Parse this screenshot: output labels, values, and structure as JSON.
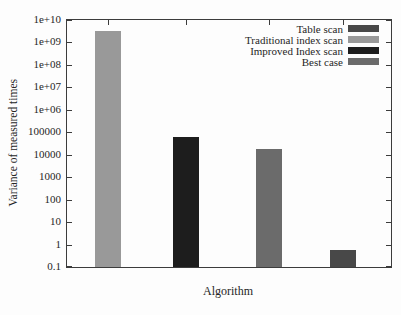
{
  "figure": {
    "background": "#fdfdfd",
    "frame_color": "#3c3c3c",
    "text_color": "#262626"
  },
  "chart_data": {
    "type": "bar",
    "title": "",
    "xlabel": "Algorithm",
    "ylabel": "Variance of measured times",
    "y_scale": "log",
    "ylim": [
      0.1,
      10000000000.0
    ],
    "grid": false,
    "yticks": {
      "labels": [
        "1e+10",
        "1e+09",
        "1e+08",
        "1e+07",
        "1e+06",
        "100000",
        "10000",
        "1000",
        "100",
        "10",
        "1",
        "0.1"
      ],
      "values": [
        10000000000.0,
        1000000000.0,
        100000000.0,
        10000000.0,
        1000000.0,
        100000,
        10000,
        1000,
        100,
        10,
        1,
        0.1
      ]
    },
    "x_tick_labels": [],
    "legend_position": "top-right-inside",
    "legend": [
      {
        "label": "Table scan",
        "color": "#484848"
      },
      {
        "label": "Traditional index scan",
        "color": "#999999"
      },
      {
        "label": "Improved Index scan",
        "color": "#1d1d1d"
      },
      {
        "label": "Best case",
        "color": "#6b6b6b"
      }
    ],
    "bars": [
      {
        "series": "Traditional index scan",
        "value": 3200000000.0,
        "x_center_frac": 0.127,
        "color": "#999999"
      },
      {
        "series": "Improved Index scan",
        "value": 60000,
        "x_center_frac": 0.367,
        "color": "#1d1d1d"
      },
      {
        "series": "Best case",
        "value": 18000,
        "x_center_frac": 0.623,
        "color": "#6b6b6b"
      },
      {
        "series": "Table scan",
        "value": 0.6,
        "x_center_frac": 0.852,
        "color": "#484848"
      }
    ]
  }
}
